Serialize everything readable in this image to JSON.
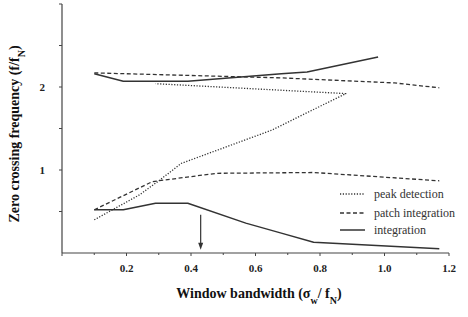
{
  "chart_data": {
    "type": "line",
    "title": "",
    "xlabel": "Window bandwidth (σw/ fN)",
    "xlabel_parts": {
      "main": "Window bandwidth (σ",
      "sub1": "w",
      "mid": "/ f",
      "sub2": "N",
      "end": ")"
    },
    "ylabel": "Zero crossing frequency (f/fN)",
    "ylabel_parts": {
      "main": "Zero crossing frequency (f/f",
      "sub": "N",
      "end": ")"
    },
    "xlim": [
      0,
      1.2
    ],
    "ylim": [
      0,
      3.0
    ],
    "x_ticks": [
      0.2,
      0.4,
      0.6,
      0.8,
      1.0,
      1.2
    ],
    "x_tick_labels": [
      "0.2",
      "0.4",
      "0.6",
      "0.8",
      "1.0",
      "1.2"
    ],
    "x_minor_ticks": [
      0.1,
      0.3,
      0.5,
      0.7,
      0.9,
      1.1
    ],
    "y_ticks": [
      0.5,
      1,
      1.5,
      2,
      2.5
    ],
    "y_tick_labels": [
      "",
      "1",
      "",
      "2",
      ""
    ],
    "grid": false,
    "legend_position": "lower right",
    "annotations": [
      {
        "type": "arrow",
        "x": 0.43,
        "y_from": 0.46,
        "y_to": 0.04
      }
    ],
    "series": [
      {
        "name": "peak detection",
        "style": "dotted",
        "segments": [
          [
            [
              0.1,
              0.4
            ],
            [
              0.24,
              0.7
            ],
            [
              0.3,
              0.87
            ],
            [
              0.37,
              1.08
            ],
            [
              0.65,
              1.48
            ],
            [
              0.88,
              1.92
            ],
            [
              0.29,
              2.04
            ]
          ]
        ]
      },
      {
        "name": "patch integration",
        "style": "dashed",
        "segments": [
          [
            [
              0.1,
              0.52
            ],
            [
              0.28,
              0.86
            ],
            [
              0.48,
              0.96
            ],
            [
              0.78,
              0.97
            ],
            [
              1.17,
              0.87
            ]
          ],
          [
            [
              0.1,
              2.17
            ],
            [
              0.68,
              2.11
            ],
            [
              1.03,
              2.05
            ],
            [
              1.17,
              1.99
            ]
          ]
        ]
      },
      {
        "name": "integration",
        "style": "solid",
        "segments": [
          [
            [
              0.1,
              0.52
            ],
            [
              0.19,
              0.52
            ],
            [
              0.29,
              0.6
            ],
            [
              0.39,
              0.6
            ],
            [
              0.57,
              0.36
            ],
            [
              0.68,
              0.24
            ],
            [
              0.78,
              0.13
            ],
            [
              1.17,
              0.05
            ]
          ],
          [
            [
              0.1,
              2.16
            ],
            [
              0.19,
              2.07
            ],
            [
              0.39,
              2.07
            ],
            [
              0.68,
              2.16
            ],
            [
              0.76,
              2.18
            ],
            [
              0.98,
              2.36
            ]
          ]
        ]
      }
    ]
  },
  "legend": {
    "items": [
      {
        "label": "peak detection",
        "style": "dotted"
      },
      {
        "label": "patch integration",
        "style": "dashed"
      },
      {
        "label": "integration",
        "style": "solid"
      }
    ]
  },
  "colors": {
    "line": "#333333",
    "axis": "#444444"
  }
}
